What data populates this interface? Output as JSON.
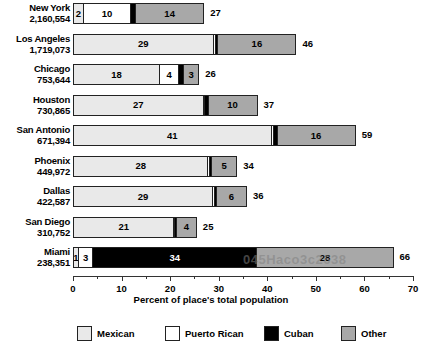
{
  "chart_data": {
    "type": "bar",
    "orientation": "horizontal",
    "stacked": true,
    "title": "",
    "xlabel": "Percent of place's total population",
    "ylabel": "",
    "xlim": [
      0,
      70
    ],
    "xticks": [
      0,
      10,
      20,
      30,
      40,
      50,
      60,
      70
    ],
    "xtick_labels": [
      "0",
      "10",
      "20",
      "30",
      "40",
      "50",
      "60",
      "70"
    ],
    "minor_ticks": [
      5,
      15,
      25,
      35,
      45,
      55,
      65
    ],
    "grid": false,
    "legend_position": "bottom",
    "series": [
      {
        "name": "Mexican",
        "color": "#e9e9e9",
        "values": [
          2,
          29,
          18,
          27,
          41,
          28,
          29,
          21,
          1
        ]
      },
      {
        "name": "Puerto Rican",
        "color": "#ffffff",
        "values": [
          10,
          0.5,
          4,
          0,
          0.5,
          0.5,
          0.5,
          0,
          3
        ]
      },
      {
        "name": "Cuban",
        "color": "#000000",
        "values": [
          1,
          0.5,
          1,
          0.5,
          1.5,
          0.5,
          0.5,
          0,
          34
        ]
      },
      {
        "name": "Other",
        "color": "#a8a8a8",
        "values": [
          14,
          16,
          3,
          10,
          16,
          5,
          6,
          4,
          28
        ]
      }
    ],
    "categories": [
      "New York",
      "Los Angeles",
      "Chicago",
      "Houston",
      "San Antonio",
      "Phoenix",
      "Dallas",
      "San Diego",
      "Miami"
    ],
    "rows": [
      {
        "city": "New York",
        "population": "2,160,554",
        "total": "27",
        "segments": [
          {
            "series": "Mexican",
            "value": 2,
            "label": "2",
            "show_label": true
          },
          {
            "series": "Puerto Rican",
            "value": 10,
            "label": "10",
            "show_label": true
          },
          {
            "series": "Cuban",
            "value": 1,
            "label": "1",
            "show_label": false
          },
          {
            "series": "Other",
            "value": 14,
            "label": "14",
            "show_label": true
          }
        ]
      },
      {
        "city": "Los Angeles",
        "population": "1,719,073",
        "total": "46",
        "segments": [
          {
            "series": "Mexican",
            "value": 29,
            "label": "29",
            "show_label": true
          },
          {
            "series": "Puerto Rican",
            "value": 0.4,
            "label": "",
            "show_label": false
          },
          {
            "series": "Cuban",
            "value": 0.6,
            "label": "",
            "show_label": false
          },
          {
            "series": "Other",
            "value": 16,
            "label": "16",
            "show_label": true
          }
        ]
      },
      {
        "city": "Chicago",
        "population": "753,644",
        "total": "26",
        "segments": [
          {
            "series": "Mexican",
            "value": 18,
            "label": "18",
            "show_label": true
          },
          {
            "series": "Puerto Rican",
            "value": 4,
            "label": "4",
            "show_label": true
          },
          {
            "series": "Cuban",
            "value": 1,
            "label": "1",
            "show_label": false
          },
          {
            "series": "Other",
            "value": 3,
            "label": "3",
            "show_label": true
          }
        ]
      },
      {
        "city": "Houston",
        "population": "730,865",
        "total": "37",
        "segments": [
          {
            "series": "Mexican",
            "value": 27,
            "label": "27",
            "show_label": true
          },
          {
            "series": "Puerto Rican",
            "value": 0.3,
            "label": "",
            "show_label": false
          },
          {
            "series": "Cuban",
            "value": 0.7,
            "label": "",
            "show_label": false
          },
          {
            "series": "Other",
            "value": 10,
            "label": "10",
            "show_label": true
          }
        ]
      },
      {
        "city": "San Antonio",
        "population": "671,394",
        "total": "59",
        "segments": [
          {
            "series": "Mexican",
            "value": 41,
            "label": "41",
            "show_label": true
          },
          {
            "series": "Puerto Rican",
            "value": 0.5,
            "label": "",
            "show_label": false
          },
          {
            "series": "Cuban",
            "value": 0.7,
            "label": "",
            "show_label": false
          },
          {
            "series": "Other",
            "value": 16,
            "label": "16",
            "show_label": true
          }
        ]
      },
      {
        "city": "Phoenix",
        "population": "449,972",
        "total": "34",
        "segments": [
          {
            "series": "Mexican",
            "value": 28,
            "label": "28",
            "show_label": true
          },
          {
            "series": "Puerto Rican",
            "value": 0.3,
            "label": "",
            "show_label": false
          },
          {
            "series": "Cuban",
            "value": 0.5,
            "label": "",
            "show_label": false
          },
          {
            "series": "Other",
            "value": 5,
            "label": "5",
            "show_label": true
          }
        ]
      },
      {
        "city": "Dallas",
        "population": "422,587",
        "total": "36",
        "segments": [
          {
            "series": "Mexican",
            "value": 29,
            "label": "29",
            "show_label": true
          },
          {
            "series": "Puerto Rican",
            "value": 0.3,
            "label": "",
            "show_label": false
          },
          {
            "series": "Cuban",
            "value": 0.5,
            "label": "",
            "show_label": false
          },
          {
            "series": "Other",
            "value": 6,
            "label": "6",
            "show_label": true
          }
        ]
      },
      {
        "city": "San Diego",
        "population": "310,752",
        "total": "25",
        "segments": [
          {
            "series": "Mexican",
            "value": 21,
            "label": "21",
            "show_label": true
          },
          {
            "series": "Puerto Rican",
            "value": 0.2,
            "label": "",
            "show_label": false
          },
          {
            "series": "Cuban",
            "value": 0.3,
            "label": "",
            "show_label": false
          },
          {
            "series": "Other",
            "value": 4,
            "label": "4",
            "show_label": true
          }
        ]
      },
      {
        "city": "Miami",
        "population": "238,351",
        "total": "66",
        "segments": [
          {
            "series": "Mexican",
            "value": 1,
            "label": "1",
            "show_label": true
          },
          {
            "series": "Puerto Rican",
            "value": 3,
            "label": "3",
            "show_label": true
          },
          {
            "series": "Cuban",
            "value": 34,
            "label": "34",
            "show_label": true
          },
          {
            "series": "Other",
            "value": 28,
            "label": "28",
            "show_label": true
          }
        ]
      }
    ],
    "legend": [
      {
        "label": "Mexican",
        "color": "#e9e9e9"
      },
      {
        "label": "Puerto Rican",
        "color": "#ffffff"
      },
      {
        "label": "Cuban",
        "color": "#000000"
      },
      {
        "label": "Other",
        "color": "#a8a8a8"
      }
    ]
  },
  "watermark": {
    "text": "045Haco3c2638"
  }
}
